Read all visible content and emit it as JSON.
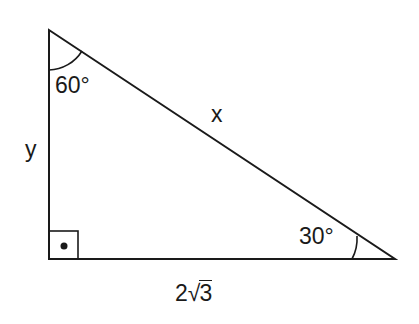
{
  "diagram": {
    "type": "right-triangle",
    "vertices": {
      "top": [
        49,
        30
      ],
      "right_angle": [
        49,
        259
      ],
      "right": [
        395,
        259
      ]
    },
    "angles": {
      "top": "60°",
      "right": "30°",
      "bottom_left": "right-angle"
    },
    "sides": {
      "hypotenuse": "x",
      "vertical_leg": "y",
      "horizontal_leg_coef": "2",
      "horizontal_leg_radicand": "3"
    },
    "stroke_color": "#1a1a1a",
    "background": "#ffffff"
  }
}
